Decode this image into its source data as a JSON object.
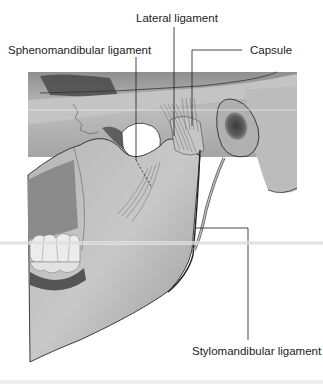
{
  "figure": {
    "labels": [
      {
        "id": "lateral",
        "text": "Lateral ligament"
      },
      {
        "id": "sphenomandibular",
        "text": "Sphenomandibular ligament"
      },
      {
        "id": "capsule",
        "text": "Capsule"
      },
      {
        "id": "stylomandibular",
        "text": "Stylomandibular ligament"
      }
    ]
  },
  "colors": {
    "background": "#ffffff",
    "bone_light": "#c9c9c9",
    "bone_mid": "#a8a8a8",
    "bone_dark": "#6e6e6e",
    "outline": "#2a2a2a",
    "leader_line": "#1a1a1a",
    "text": "#222222"
  }
}
